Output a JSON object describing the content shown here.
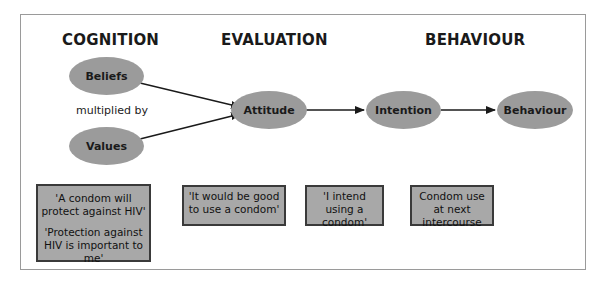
{
  "headings": {
    "cognition": "COGNITION",
    "evaluation": "EVALUATION",
    "behaviour": "BEHAVIOUR"
  },
  "nodes": {
    "beliefs": "Beliefs",
    "values": "Values",
    "attitude": "Attitude",
    "intention": "Intention",
    "behaviour": "Behaviour"
  },
  "connector_label": "multiplied by",
  "boxes": {
    "cognition": [
      "'A condom will protect against HIV'",
      "'Protection against HIV is important to me'"
    ],
    "evaluation": "'It would be good to use a condom'",
    "intention": "'I intend using a condom'",
    "behaviour": "Condom use at next intercourse"
  },
  "colors": {
    "node_fill": "#9b9b9b",
    "box_fill": "#a8a8a8",
    "box_border": "#3a3a3a",
    "arrow": "#1a1a1a"
  }
}
